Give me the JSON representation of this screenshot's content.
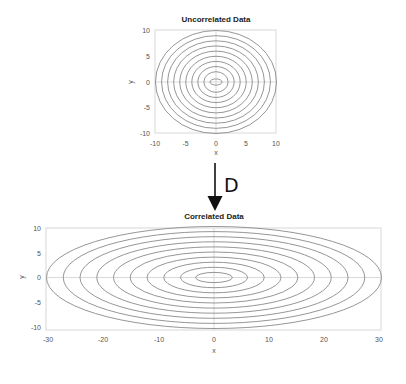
{
  "diagram": {
    "transform_label": "D",
    "arrow_direction": "down",
    "colors": {
      "contour": "#8a8a8a",
      "frame": "#d8d8d8",
      "zero_line": "#cfcfcf",
      "arrow": "#111111"
    }
  },
  "chart_data": [
    {
      "type": "contour",
      "title": "Uncorrelated Data",
      "xlabel": "x",
      "ylabel": "y",
      "xlim": [
        -10,
        10
      ],
      "ylim": [
        -10,
        10
      ],
      "xticks": [
        "-10",
        "-5",
        "0",
        "5",
        "10"
      ],
      "yticks": [
        "10",
        "5",
        "0",
        "-5",
        "-10"
      ],
      "center": [
        0,
        0
      ],
      "contours": [
        {
          "rx": 1.0,
          "ry": 0.6
        },
        {
          "rx": 2,
          "ry": 2
        },
        {
          "rx": 3,
          "ry": 3
        },
        {
          "rx": 4,
          "ry": 4
        },
        {
          "rx": 5,
          "ry": 5
        },
        {
          "rx": 6,
          "ry": 6
        },
        {
          "rx": 7,
          "ry": 7
        },
        {
          "rx": 8,
          "ry": 8
        },
        {
          "rx": 9,
          "ry": 9
        },
        {
          "rx": 10,
          "ry": 10
        }
      ]
    },
    {
      "type": "contour",
      "title": "Correlated Data",
      "xlabel": "x",
      "ylabel": "y",
      "xlim": [
        -30,
        30
      ],
      "ylim": [
        -10,
        10
      ],
      "xticks": [
        "-30",
        "-20",
        "-10",
        "0",
        "10",
        "20",
        "30"
      ],
      "yticks": [
        "10",
        "5",
        "0",
        "-5",
        "-10"
      ],
      "center": [
        0,
        0
      ],
      "contours": [
        {
          "rx": 3.3,
          "ry": 1.0
        },
        {
          "rx": 6,
          "ry": 2
        },
        {
          "rx": 9,
          "ry": 3
        },
        {
          "rx": 12,
          "ry": 4
        },
        {
          "rx": 15,
          "ry": 5
        },
        {
          "rx": 18,
          "ry": 6
        },
        {
          "rx": 21,
          "ry": 7
        },
        {
          "rx": 24,
          "ry": 8
        },
        {
          "rx": 27,
          "ry": 9
        },
        {
          "rx": 30,
          "ry": 10
        }
      ]
    }
  ]
}
